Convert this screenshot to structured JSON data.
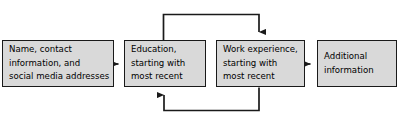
{
  "diagram": {
    "type": "flowchart",
    "orientation": "left-to-right",
    "title": "",
    "style": {
      "box_fill": "#d9d9d9",
      "box_border": "#1a1a1a",
      "connector_color": "#1a1a1a",
      "background": "#ffffff",
      "text_color": "#000000"
    },
    "nodes": [
      {
        "id": "contact",
        "label_lines": [
          "Name, contact",
          "information, and",
          "social media addresses"
        ],
        "label": "Name, contact information, and social media addresses"
      },
      {
        "id": "education",
        "label_lines": [
          "Education,",
          "starting with",
          "most recent"
        ],
        "label": "Education, starting with most recent"
      },
      {
        "id": "work",
        "label_lines": [
          "Work experience,",
          "starting with",
          "most recent"
        ],
        "label": "Work experience, starting with most recent"
      },
      {
        "id": "additional",
        "label_lines": [
          "Additional",
          "information"
        ],
        "label": "Additional information"
      }
    ],
    "connectors": [
      {
        "id": "contact-to-education",
        "from": "contact",
        "to": "education",
        "kind": "straight-arrow",
        "direction": "right"
      },
      {
        "id": "work-to-additional",
        "from": "work",
        "to": "additional",
        "kind": "straight-arrow",
        "direction": "right"
      },
      {
        "id": "education-to-work-top",
        "from": "education",
        "to": "work",
        "kind": "elbow-arrow",
        "direction": "over-the-top"
      },
      {
        "id": "work-to-education-bottom",
        "from": "work",
        "to": "education",
        "kind": "elbow-arrow",
        "direction": "under-the-bottom"
      }
    ]
  }
}
